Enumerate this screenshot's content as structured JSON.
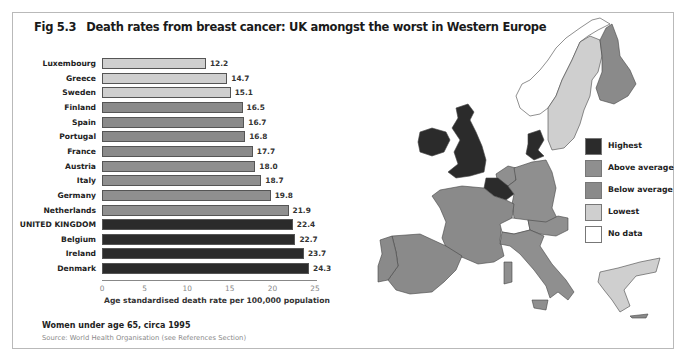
{
  "figure": {
    "number": "Fig 5.3",
    "title": "Death rates from breast cancer:  UK amongst the worst in Western Europe",
    "note": "Women under age 65, circa 1995",
    "source": "Source: World Health Organisation (see References Section)"
  },
  "colors": {
    "highest": "#2b2b2b",
    "above_average": "#8f8f8f",
    "below_average": "#8a8a8a",
    "lowest": "#cfcfcf",
    "no_data": "#ffffff"
  },
  "legend": [
    {
      "label": "Highest",
      "key": "highest"
    },
    {
      "label": "Above average",
      "key": "above_average"
    },
    {
      "label": "Below average",
      "key": "below_average"
    },
    {
      "label": "Lowest",
      "key": "lowest"
    },
    {
      "label": "No data",
      "key": "no_data"
    }
  ],
  "chart_data": {
    "type": "bar",
    "orientation": "horizontal",
    "title": "Death rates from breast cancer:  UK amongst the worst in Western Europe",
    "xlabel": "Age standardised death rate per 100,000 population",
    "ylabel": "",
    "xlim": [
      0,
      25
    ],
    "xticks": [
      "0",
      "5",
      "10",
      "15",
      "20",
      "25"
    ],
    "grid": false,
    "categories": [
      "Luxembourg",
      "Greece",
      "Sweden",
      "Finland",
      "Spain",
      "Portugal",
      "France",
      "Austria",
      "Italy",
      "Germany",
      "Netherlands",
      "UNITED KINGDOM",
      "Belgium",
      "Ireland",
      "Denmark"
    ],
    "values": [
      12.2,
      14.7,
      15.1,
      16.5,
      16.7,
      16.8,
      17.7,
      18.0,
      18.7,
      19.8,
      21.9,
      22.4,
      22.7,
      23.7,
      24.3
    ],
    "value_labels": [
      "12.2",
      "14.7",
      "15.1",
      "16.5",
      "16.7",
      "16.8",
      "17.7",
      "18.0",
      "18.7",
      "19.8",
      "21.9",
      "22.4",
      "22.7",
      "23.7",
      "24.3"
    ],
    "groups": [
      "lowest",
      "lowest",
      "lowest",
      "below_average",
      "below_average",
      "below_average",
      "below_average",
      "above_average",
      "above_average",
      "above_average",
      "above_average",
      "highest",
      "highest",
      "highest",
      "highest"
    ],
    "annotations": [
      "Women under age 65, circa 1995"
    ],
    "legend_position": "right (on map)"
  },
  "map": {
    "title": "Western Europe choropleth",
    "regions": [
      {
        "name": "United Kingdom",
        "group": "highest"
      },
      {
        "name": "Ireland",
        "group": "highest"
      },
      {
        "name": "Belgium",
        "group": "highest"
      },
      {
        "name": "Denmark",
        "group": "highest"
      },
      {
        "name": "Netherlands",
        "group": "above_average"
      },
      {
        "name": "Germany",
        "group": "above_average"
      },
      {
        "name": "Austria",
        "group": "above_average"
      },
      {
        "name": "Italy",
        "group": "above_average"
      },
      {
        "name": "France",
        "group": "below_average"
      },
      {
        "name": "Spain",
        "group": "below_average"
      },
      {
        "name": "Portugal",
        "group": "below_average"
      },
      {
        "name": "Finland",
        "group": "below_average"
      },
      {
        "name": "Sweden",
        "group": "lowest"
      },
      {
        "name": "Greece",
        "group": "lowest"
      },
      {
        "name": "Norway",
        "group": "no_data"
      },
      {
        "name": "Switzerland",
        "group": "no_data"
      }
    ]
  }
}
